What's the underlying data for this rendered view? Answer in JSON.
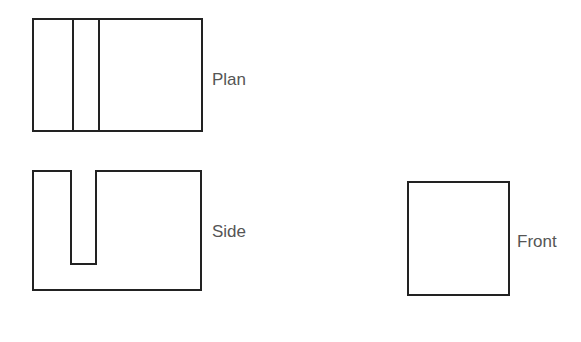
{
  "diagram": {
    "type": "orthographic-projection",
    "views": [
      {
        "id": "plan",
        "label": "Plan"
      },
      {
        "id": "side",
        "label": "Side"
      },
      {
        "id": "front",
        "label": "Front"
      }
    ],
    "colors": {
      "stroke": "#222222",
      "label": "#555555",
      "background": "#ffffff"
    }
  }
}
